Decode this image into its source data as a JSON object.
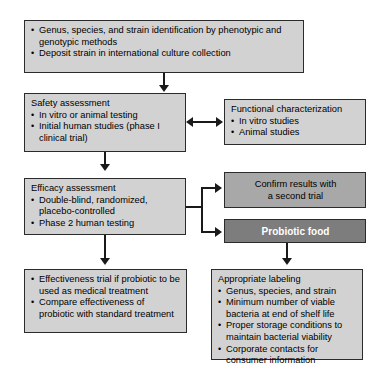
{
  "diagram": {
    "colors": {
      "box_light": "#d2d2d2",
      "box_mid": "#a8a8a8",
      "box_dark": "#7d7d7d",
      "border": "#2b2b2b",
      "connector": "#1a1a1a",
      "text_dark": "#000000",
      "text_light": "#ffffff"
    },
    "nodes": {
      "identification": {
        "header": "",
        "items": [
          "Genus, species, and strain identification by phenotypic and genotypic methods",
          "Deposit strain in international culture collection"
        ]
      },
      "safety": {
        "header": "Safety assessment",
        "items": [
          "In vitro or animal testing",
          "Initial human studies (phase I clinical trial)"
        ]
      },
      "functional": {
        "header": "Functional characterization",
        "items": [
          "In vitro studies",
          "Animal studies"
        ]
      },
      "efficacy": {
        "header": "Efficacy assessment",
        "items": [
          "Double-blind, randomized, placebo-controlled",
          "Phase 2 human testing"
        ]
      },
      "confirm": {
        "lines": [
          "Confirm results with",
          "a second trial"
        ]
      },
      "probiotic_food": {
        "lines": [
          "Probiotic food"
        ]
      },
      "effectiveness": {
        "header": "",
        "items": [
          "Effectiveness trial if probiotic to be used as medical treatment",
          "Compare effectiveness of probiotic with standard treatment"
        ]
      },
      "labeling": {
        "header": "Appropriate labeling",
        "items": [
          "Genus, species, and strain",
          "Minimum number of viable bacteria at end of shelf life",
          "Proper storage conditions to maintain bacterial viability",
          "Corporate contacts for consumer information"
        ]
      }
    },
    "connectors": [
      "identification-to-safety-arrow-down",
      "safety-functional-bidirectional-arrow",
      "safety-to-efficacy-arrow-down",
      "efficacy-to-confirm-arrow-right",
      "efficacy-to-probiotic-food-arrow-right",
      "efficacy-to-effectiveness-arrow-down",
      "probiotic-food-to-labeling-arrow-down"
    ]
  }
}
